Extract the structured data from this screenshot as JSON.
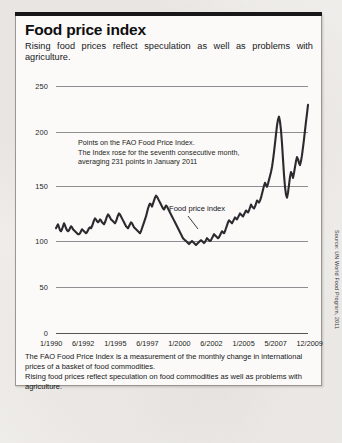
{
  "header": {
    "title": "Food price index",
    "subtitle": "Rising food prices reflect speculation as well as problems with agriculture."
  },
  "annotation": {
    "line1": "Points on the FAO Food Price Index.",
    "line2": "The Index rose for the seventh consecutive month,",
    "line3": "averaging 231 points in January 2011"
  },
  "series_label": "Food price index",
  "footer": {
    "line1": "The FAO Food Price Index is a measurement of the monthly change in international",
    "line2": "prices of a basket of food commodities.",
    "line3": "Rising food prices reflect speculation on food commodities as well as problems with",
    "line4": "agriculture."
  },
  "source": "Source: UN World Food Program, 2011",
  "colors": {
    "line": "#2b2b2f",
    "grid": "#8d8d92",
    "accent": "#17171a",
    "card": "#fbfaf8",
    "page": "#efedea"
  },
  "chart_data": {
    "type": "line",
    "title": "Food price index",
    "xlabel": "",
    "ylabel": "",
    "ylim": [
      0,
      250
    ],
    "yticks": [
      0,
      50,
      100,
      150,
      200,
      250
    ],
    "grid": true,
    "legend": "none",
    "xticklabels": [
      "1/1990",
      "6/1992",
      "1/1995",
      "6/1997",
      "1/2000",
      "6/2002",
      "1/2005",
      "5/2007",
      "12/2009"
    ],
    "x_start": "1/1990",
    "x_end": "1/2011",
    "annotations": [
      "Points on the FAO Food Price Index.",
      "The Index rose for the seventh consecutive month, averaging 231 points in January 2011"
    ],
    "series": [
      {
        "name": "Food price index",
        "values": [
          106,
          108,
          110,
          107,
          104,
          103,
          105,
          108,
          111,
          109,
          106,
          104,
          103,
          104,
          106,
          108,
          107,
          105,
          104,
          103,
          102,
          101,
          100,
          100,
          101,
          103,
          105,
          104,
          103,
          102,
          101,
          102,
          104,
          106,
          107,
          106,
          108,
          111,
          114,
          116,
          115,
          113,
          112,
          113,
          115,
          114,
          112,
          111,
          110,
          112,
          115,
          118,
          120,
          119,
          117,
          115,
          114,
          113,
          112,
          111,
          113,
          116,
          119,
          121,
          120,
          118,
          116,
          114,
          112,
          110,
          108,
          107,
          106,
          108,
          110,
          112,
          111,
          109,
          107,
          106,
          105,
          104,
          103,
          102,
          101,
          103,
          106,
          109,
          112,
          115,
          118,
          122,
          126,
          129,
          131,
          130,
          128,
          131,
          134,
          137,
          139,
          138,
          136,
          134,
          132,
          130,
          128,
          126,
          125,
          127,
          129,
          128,
          126,
          124,
          122,
          120,
          118,
          116,
          114,
          112,
          110,
          108,
          106,
          104,
          102,
          100,
          98,
          96,
          95,
          94,
          93,
          92,
          91,
          90,
          91,
          92,
          93,
          92,
          91,
          90,
          89,
          90,
          91,
          92,
          93,
          94,
          93,
          92,
          91,
          92,
          94,
          96,
          95,
          94,
          93,
          94,
          96,
          98,
          100,
          99,
          98,
          97,
          96,
          97,
          99,
          101,
          103,
          102,
          101,
          103,
          106,
          109,
          112,
          114,
          113,
          112,
          111,
          113,
          115,
          117,
          116,
          115,
          117,
          119,
          121,
          120,
          119,
          118,
          120,
          122,
          124,
          123,
          122,
          124,
          127,
          130,
          128,
          127,
          126,
          128,
          131,
          134,
          133,
          132,
          134,
          137,
          141,
          145,
          149,
          152,
          150,
          148,
          151,
          155,
          159,
          163,
          168,
          175,
          183,
          192,
          201,
          210,
          216,
          219,
          214,
          205,
          192,
          176,
          160,
          148,
          140,
          137,
          142,
          150,
          158,
          163,
          161,
          157,
          162,
          168,
          174,
          178,
          176,
          172,
          170,
          174,
          180,
          188,
          196,
          205,
          214,
          222,
          231
        ]
      }
    ],
    "callouts": [
      {
        "text": "Food price index",
        "points_to": "series"
      }
    ],
    "notable_values": {
      "jan_2011": 231,
      "peak_2008": 219,
      "trough_1999_2000": 89,
      "start_1990": 106
    }
  }
}
